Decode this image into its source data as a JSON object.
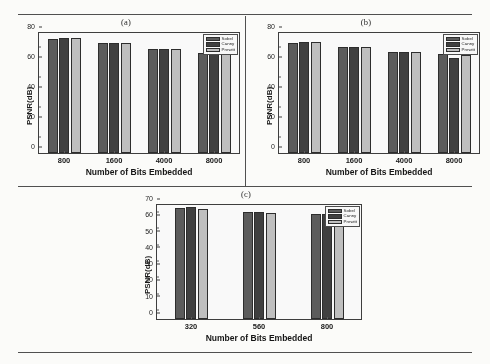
{
  "figure": {
    "panel_a_title": "(a)",
    "panel_b_title": "(b)",
    "panel_c_title": "(c)"
  },
  "legend": {
    "sobel": "Sobel",
    "canny": "Canny",
    "prewitt": "Prewitt"
  },
  "colors": {
    "sobel": "#5a5a5a",
    "canny": "#3d3d3d",
    "prewitt": "#c2c2c2",
    "axis": "#3b3b3b",
    "rule": "#4e4e50",
    "background": "#fbfbf9"
  },
  "axis_labels": {
    "x": "Number of Bits Embedded",
    "y": "PSNR(dB)"
  },
  "chart_data": [
    {
      "type": "bar",
      "title": "(a)",
      "xlabel": "Number of Bits Embedded",
      "ylabel": "PSNR(dB)",
      "categories": [
        "800",
        "1600",
        "4000",
        "8000"
      ],
      "yticks": [
        0,
        20,
        40,
        60,
        80
      ],
      "ylim": [
        0,
        80
      ],
      "grid": false,
      "legend_position": "top-right",
      "series": [
        {
          "name": "Sobel",
          "values": [
            76.3,
            73.4,
            69.2,
            67.0
          ]
        },
        {
          "name": "Canny",
          "values": [
            76.4,
            73.5,
            69.2,
            66.8
          ]
        },
        {
          "name": "Prewitt",
          "values": [
            76.7,
            73.4,
            69.1,
            67.0
          ]
        }
      ]
    },
    {
      "type": "bar",
      "title": "(b)",
      "xlabel": "Number of Bits Embedded",
      "ylabel": "PSNR(dB)",
      "categories": [
        "800",
        "1600",
        "4000",
        "8000"
      ],
      "yticks": [
        0,
        20,
        40,
        60,
        80
      ],
      "ylim": [
        0,
        80
      ],
      "grid": false,
      "legend_position": "top-right",
      "series": [
        {
          "name": "Sobel",
          "values": [
            73.6,
            70.6,
            67.2,
            65.8
          ]
        },
        {
          "name": "Canny",
          "values": [
            74.0,
            70.7,
            67.3,
            63.2
          ]
        },
        {
          "name": "Prewitt",
          "values": [
            73.7,
            70.8,
            67.1,
            65.5
          ]
        }
      ]
    },
    {
      "type": "bar",
      "title": "(c)",
      "xlabel": "Number of Bits Embedded",
      "ylabel": "PSNR(dB)",
      "categories": [
        "320",
        "560",
        "800"
      ],
      "yticks": [
        0,
        10,
        20,
        30,
        40,
        50,
        60,
        70
      ],
      "ylim": [
        0,
        70
      ],
      "grid": false,
      "legend_position": "top-right",
      "series": [
        {
          "name": "Sobel",
          "values": [
            68.4,
            66.0,
            64.4
          ]
        },
        {
          "name": "Canny",
          "values": [
            68.7,
            66.0,
            64.5
          ]
        },
        {
          "name": "Prewitt",
          "values": [
            67.6,
            65.2,
            63.6
          ]
        }
      ]
    }
  ]
}
